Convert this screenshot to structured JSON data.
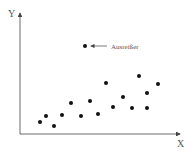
{
  "chart_data": {
    "type": "scatter",
    "title": "",
    "xlabel": "X",
    "ylabel": "Y",
    "grid": false,
    "legend": null,
    "points": [
      {
        "x": 40,
        "y": 122
      },
      {
        "x": 46,
        "y": 116
      },
      {
        "x": 54,
        "y": 126
      },
      {
        "x": 62,
        "y": 115
      },
      {
        "x": 71,
        "y": 103
      },
      {
        "x": 81,
        "y": 116
      },
      {
        "x": 90,
        "y": 101
      },
      {
        "x": 98,
        "y": 114
      },
      {
        "x": 106,
        "y": 83
      },
      {
        "x": 113,
        "y": 107
      },
      {
        "x": 123,
        "y": 97
      },
      {
        "x": 132,
        "y": 108
      },
      {
        "x": 139,
        "y": 76
      },
      {
        "x": 147,
        "y": 93
      },
      {
        "x": 147,
        "y": 108
      },
      {
        "x": 158,
        "y": 84
      }
    ],
    "outlier": {
      "x": 85,
      "y": 46
    },
    "annotations": [
      {
        "text": "Ausreißer",
        "points_to": "outlier"
      }
    ]
  },
  "labels": {
    "x_axis": "X",
    "y_axis": "Y",
    "outlier_label": "Ausreißer"
  }
}
